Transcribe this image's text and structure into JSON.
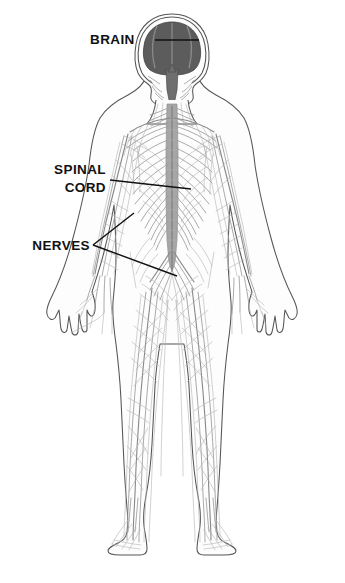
{
  "figure": {
    "background_color": "#ffffff"
  },
  "labels": [
    {
      "id": "brain",
      "text": "BRAIN",
      "text_x": 90,
      "text_y": 44,
      "anchor": "start",
      "leader_path": "M 155 40 L 199 40",
      "target": "cerebrum"
    },
    {
      "id": "spinal_cord_line1",
      "text": "SPINAL",
      "text_x": 106,
      "text_y": 174,
      "anchor": "end",
      "leader_path": "M 110 180 L 191 189",
      "target": "spinal-cord-thoracic"
    },
    {
      "id": "spinal_cord_line2",
      "text": "CORD",
      "text_x": 106,
      "text_y": 192,
      "anchor": "end",
      "leader_path": "",
      "target": ""
    },
    {
      "id": "nerves",
      "text": "NERVES",
      "text_x": 90,
      "text_y": 250,
      "anchor": "end",
      "leader_path": "M 93 245 L 134 213 M 93 245 L 177 276",
      "target": "peripheral-nerves"
    }
  ],
  "colors": {
    "brain_fill": "#5c5c5c",
    "body_outline": "#555555",
    "nerve_gray": "#9b9b9b",
    "nerve_light": "#b2b2b2",
    "cord_gray": "#a6a6a6",
    "label_text": "#111111",
    "background": "#ffffff"
  },
  "anatomy": {
    "regions": [
      "head-skull",
      "brain-cerebrum",
      "brainstem",
      "neck-cervical",
      "shoulders-brachial-plexus",
      "thorax",
      "spinal-cord",
      "abdomen",
      "pelvis-cauda-equina",
      "left-arm",
      "right-arm",
      "left-hand",
      "right-hand",
      "left-leg",
      "right-leg",
      "left-foot",
      "right-foot"
    ]
  }
}
